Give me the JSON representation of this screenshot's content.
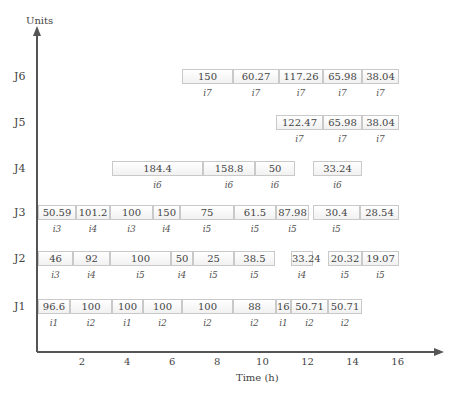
{
  "chart_data": {
    "type": "gantt",
    "title": "",
    "xlabel": "Time (h)",
    "ylabel": "Units",
    "x_ticks": [
      "2",
      "4",
      "6",
      "8",
      "10",
      "12",
      "14",
      "16"
    ],
    "rows": [
      {
        "label": "J6",
        "segments": [
          {
            "value": "150",
            "task": "i7",
            "x0": 182,
            "x1": 233
          },
          {
            "value": "60.27",
            "task": "i7",
            "x0": 233,
            "x1": 279
          },
          {
            "value": "117.26",
            "task": "i7",
            "x0": 279,
            "x1": 323
          },
          {
            "value": "65.98",
            "task": "i7",
            "x0": 323,
            "x1": 362
          },
          {
            "value": "38.04",
            "task": "i7",
            "x0": 362,
            "x1": 399
          }
        ]
      },
      {
        "label": "J5",
        "segments": [
          {
            "value": "122.47",
            "task": "i7",
            "x0": 276,
            "x1": 323
          },
          {
            "value": "65.98",
            "task": "i7",
            "x0": 323,
            "x1": 362
          },
          {
            "value": "38.04",
            "task": "i7",
            "x0": 362,
            "x1": 399
          }
        ]
      },
      {
        "label": "J4",
        "segments": [
          {
            "value": "184.4",
            "task": "i6",
            "x0": 112,
            "x1": 203
          },
          {
            "value": "158.8",
            "task": "i6",
            "x0": 203,
            "x1": 255
          },
          {
            "value": "50",
            "task": "i6",
            "x0": 255,
            "x1": 295
          },
          {
            "value": "33.24",
            "task": "i6",
            "x0": 313,
            "x1": 362
          }
        ]
      },
      {
        "label": "J3",
        "segments": [
          {
            "value": "50.59",
            "task": "i3",
            "x0": 38,
            "x1": 76
          },
          {
            "value": "101.2",
            "task": "i4",
            "x0": 76,
            "x1": 110
          },
          {
            "value": "100",
            "task": "i3",
            "x0": 110,
            "x1": 153
          },
          {
            "value": "150",
            "task": "i4",
            "x0": 153,
            "x1": 180
          },
          {
            "value": "75",
            "task": "i5",
            "x0": 180,
            "x1": 234
          },
          {
            "value": "61.5",
            "task": "i5",
            "x0": 234,
            "x1": 276
          },
          {
            "value": "87.98",
            "task": "i5",
            "x0": 276,
            "x1": 309
          },
          {
            "value": "30.4",
            "task": "i5",
            "x0": 313,
            "x1": 360
          },
          {
            "value": "28.54",
            "task": "",
            "x0": 360,
            "x1": 399
          }
        ]
      },
      {
        "label": "J2",
        "segments": [
          {
            "value": "46",
            "task": "i3",
            "x0": 38,
            "x1": 73
          },
          {
            "value": "92",
            "task": "i4",
            "x0": 73,
            "x1": 110
          },
          {
            "value": "100",
            "task": "i5",
            "x0": 110,
            "x1": 171
          },
          {
            "value": "50",
            "task": "i4",
            "x0": 171,
            "x1": 193
          },
          {
            "value": "25",
            "task": "i5",
            "x0": 193,
            "x1": 234
          },
          {
            "value": "38.5",
            "task": "i5",
            "x0": 234,
            "x1": 275
          },
          {
            "value": "33.24",
            "task": "i4",
            "x0": 291,
            "x1": 313
          },
          {
            "value": "20.32",
            "task": "i5",
            "x0": 328,
            "x1": 362
          },
          {
            "value": "19.07",
            "task": "i5",
            "x0": 362,
            "x1": 399
          }
        ]
      },
      {
        "label": "J1",
        "segments": [
          {
            "value": "96.6",
            "task": "i1",
            "x0": 38,
            "x1": 70
          },
          {
            "value": "100",
            "task": "i2",
            "x0": 70,
            "x1": 112
          },
          {
            "value": "100",
            "task": "i1",
            "x0": 112,
            "x1": 143
          },
          {
            "value": "100",
            "task": "i2",
            "x0": 143,
            "x1": 182
          },
          {
            "value": "100",
            "task": "i2",
            "x0": 182,
            "x1": 233
          },
          {
            "value": "88",
            "task": "i2",
            "x0": 233,
            "x1": 276
          },
          {
            "value": "16.6",
            "task": "i1",
            "x0": 276,
            "x1": 291
          },
          {
            "value": "50.71",
            "task": "i2",
            "x0": 291,
            "x1": 328
          },
          {
            "value": "50.71",
            "task": "i2",
            "x0": 328,
            "x1": 362
          }
        ]
      }
    ],
    "axis_color": "#555555",
    "segment_border_color": "#c9c9c9"
  }
}
